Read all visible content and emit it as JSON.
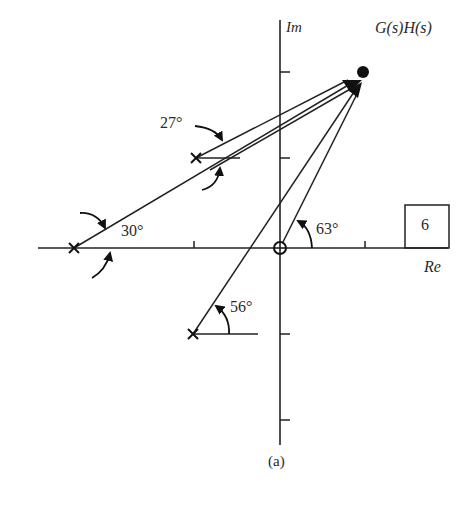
{
  "figure": {
    "caption": "(a)",
    "axes": {
      "imag_label": "Im",
      "real_label": "Re"
    },
    "function_label": "G(s)H(s)",
    "box_label": "6",
    "angles": {
      "pole_upper": "27°",
      "pole_left": "30°",
      "pole_lower": "56°",
      "zero_origin": "63°"
    },
    "elements": {
      "poles": [
        {
          "name": "pole-left",
          "x": 74,
          "y": 248
        },
        {
          "name": "pole-upper",
          "x": 196,
          "y": 158
        },
        {
          "name": "pole-lower",
          "x": 193,
          "y": 334
        }
      ],
      "zero": {
        "name": "zero-origin",
        "x": 280,
        "y": 248
      },
      "test_point": {
        "x": 362,
        "y": 72
      }
    }
  }
}
